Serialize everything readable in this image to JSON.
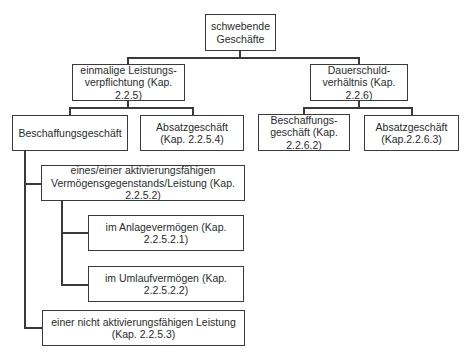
{
  "diagram": {
    "type": "tree",
    "root": {
      "label": "schwebende Geschäfte"
    },
    "level1": [
      {
        "label": "einmalige Leistungs-verpflichtung (Kap. 2.2.5)"
      },
      {
        "label": "Dauerschuld-verhältnis (Kap. 2.2.6)"
      }
    ],
    "level2_left": [
      {
        "label": "Beschaffungsgeschäft"
      },
      {
        "label": "Absatzgeschäft (Kap. 2.2.5.4)"
      }
    ],
    "level2_right": [
      {
        "label": "Beschaffungs-geschäft (Kap. 2.2.6.2)"
      },
      {
        "label": "Absatzgeschäft (Kap.2.2.6.3)"
      }
    ],
    "beschaffung_children": [
      {
        "label": "eines/einer aktivierungsfähigen Vermögensgegenstands/Leistung (Kap. 2.2.5.2)"
      },
      {
        "label": "einer nicht aktivierungsfähigen Leistung (Kap. 2.2.5.3)"
      }
    ],
    "aktivierung_children": [
      {
        "label": "im Anlagevermögen (Kap. 2.2.5.2.1)"
      },
      {
        "label": "im Umlaufvermögen (Kap. 2.2.5.2.2)"
      }
    ]
  },
  "colors": {
    "line": "#3a3a3a",
    "text": "#2b2b2b",
    "background": "#ffffff"
  }
}
